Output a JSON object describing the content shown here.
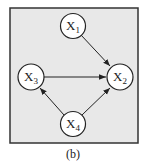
{
  "diagram": {
    "type": "directed-graph",
    "caption": "(b)",
    "colors": {
      "panel_bg": "#e8e8e8",
      "border": "#333333",
      "node_fill": "#ffffff",
      "edge": "#222222"
    },
    "nodes": [
      {
        "id": "x1",
        "label": "X",
        "sub": "1",
        "cx": 73,
        "cy": 26
      },
      {
        "id": "x2",
        "label": "X",
        "sub": "2",
        "cx": 120,
        "cy": 77
      },
      {
        "id": "x3",
        "label": "X",
        "sub": "3",
        "cx": 31,
        "cy": 77
      },
      {
        "id": "x4",
        "label": "X",
        "sub": "4",
        "cx": 73,
        "cy": 124
      }
    ],
    "edges": [
      {
        "from": "x1",
        "to": "x2"
      },
      {
        "from": "x3",
        "to": "x2"
      },
      {
        "from": "x4",
        "to": "x3"
      },
      {
        "from": "x4",
        "to": "x2"
      }
    ]
  }
}
